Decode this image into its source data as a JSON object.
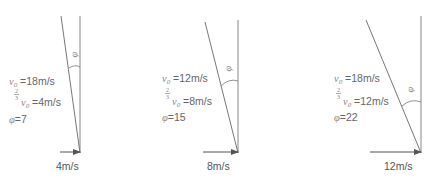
{
  "diagrams": [
    {
      "v0_label": "v",
      "v0_sub": "0",
      "v0_value": "=18m/s",
      "frac_num": "2",
      "frac_den": "3",
      "two_thirds_value": "=4m/s",
      "phi_symbol": "φ",
      "phi_value": "=7",
      "angle_label": "φ",
      "arrow_label": "4m/s"
    },
    {
      "v0_label": "v",
      "v0_sub": "0",
      "v0_value": "=12m/s",
      "frac_num": "2",
      "frac_den": "3",
      "two_thirds_value": "=8m/s",
      "phi_symbol": "φ",
      "phi_value": "=15",
      "angle_label": "φ",
      "arrow_label": "8m/s"
    },
    {
      "v0_label": "v",
      "v0_sub": "0",
      "v0_value": "=18m/s",
      "frac_num": "2",
      "frac_den": "3",
      "two_thirds_value": "=12m/s",
      "phi_symbol": "φ",
      "phi_value": "=22",
      "angle_label": "φ",
      "arrow_label": "12m/s"
    }
  ],
  "colors": {
    "line": "#777777",
    "text": "#666666"
  }
}
